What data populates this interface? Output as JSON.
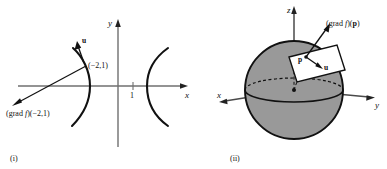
{
  "figure": {
    "background_color": "#ffffff",
    "ink_color": "#111111",
    "sphere_fill_color": "#999999",
    "tangent_plane_fill_color": "#ffffff"
  },
  "panel_i": {
    "caption": "(i)",
    "description": "Level curve hyperbola in the plane with gradient vector and unit vector u at the point (-2,1)",
    "axes": {
      "x_label": "x",
      "y_label": "y",
      "x_tick_label": "1"
    },
    "labels": {
      "point_label": "(−2,1)",
      "gradient_label_prefix": "(grad ",
      "gradient_label_f": "f",
      "gradient_label_suffix": ")(−2,1)",
      "unit_vector_label": "u"
    },
    "curves": [
      {
        "name": "left-branch",
        "style": "solid"
      },
      {
        "name": "right-branch",
        "style": "solid"
      }
    ]
  },
  "panel_ii": {
    "caption": "(ii)",
    "description": "Level surface sphere in 3-space with tangent plane at p, gradient vector and unit vector u",
    "axes": {
      "x_label": "x",
      "y_label": "y",
      "z_label": "z"
    },
    "labels": {
      "point_label": "p",
      "gradient_label_prefix": "(grad ",
      "gradient_label_f": "f",
      "gradient_label_suffix": ")(",
      "gradient_label_p": "p",
      "gradient_label_close": ")",
      "unit_vector_label": "u"
    },
    "shapes": [
      {
        "name": "sphere",
        "fill": "#999999"
      },
      {
        "name": "equator-ellipse",
        "style": "front-solid-back-dashed"
      },
      {
        "name": "tangent-plane-parallelogram",
        "fill": "#ffffff"
      },
      {
        "name": "radius-dashed-line",
        "style": "dashed"
      }
    ]
  }
}
